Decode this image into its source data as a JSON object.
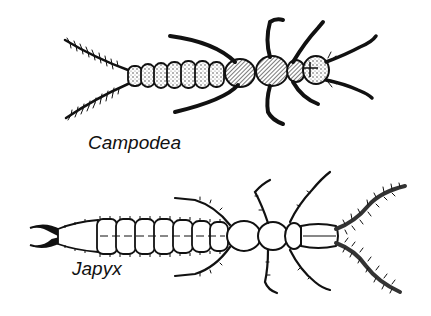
{
  "figure": {
    "specimens": [
      {
        "name": "Campodea",
        "features": [
          "long bristled cerci",
          "segmented abdomen",
          "three pairs of legs",
          "long antennae"
        ]
      },
      {
        "name": "Japyx",
        "features": [
          "pincer-like forceps cerci",
          "segmented abdomen",
          "three pairs of hairy legs",
          "long hairy antennae"
        ]
      }
    ],
    "labels": {
      "top": "Campodea",
      "bottom": "Japyx"
    },
    "colors": {
      "ink": "#111111",
      "background": "#ffffff",
      "shading": "#555555"
    }
  }
}
